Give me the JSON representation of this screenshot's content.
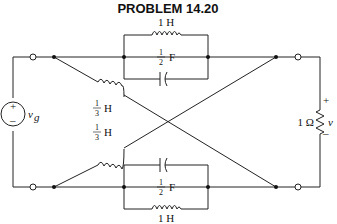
{
  "title": "PROBLEM 14.20",
  "source": {
    "label": "v",
    "subscript": "g",
    "plus": "+",
    "minus": "–"
  },
  "load": {
    "resistance": "1 Ω",
    "voltage_label": "v",
    "plus": "+",
    "minus": "–"
  },
  "top_branch": {
    "inductor": {
      "value": "1 H"
    },
    "capacitor": {
      "num": "1",
      "den": "2",
      "unit": "F"
    }
  },
  "bottom_branch": {
    "inductor": {
      "value": "1 H"
    },
    "capacitor": {
      "num": "1",
      "den": "2",
      "unit": "F"
    }
  },
  "cross_branches": [
    {
      "num": "1",
      "den": "3",
      "unit": "H"
    },
    {
      "num": "1",
      "den": "3",
      "unit": "H"
    }
  ],
  "colors": {
    "wire": "#222222",
    "background": "#ffffff"
  }
}
